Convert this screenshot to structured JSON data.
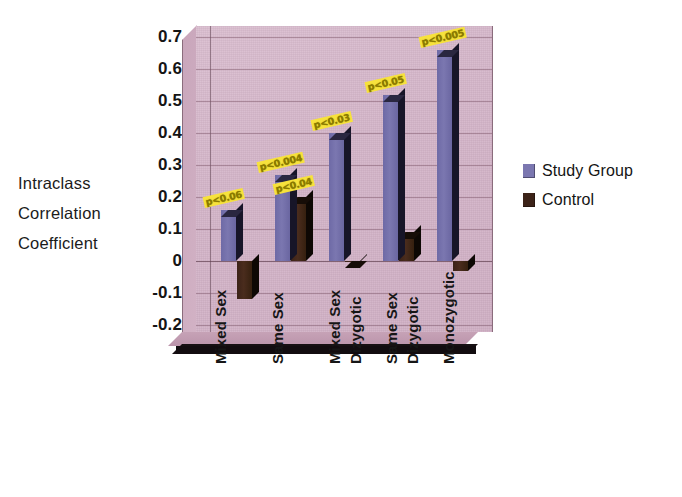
{
  "axis_title_lines": [
    "Intraclass",
    "Correlation",
    "Coefficient"
  ],
  "legend": {
    "items": [
      {
        "label": "Study Group",
        "color": "#7b77b0",
        "name": "legend-study-group"
      },
      {
        "label": "Control",
        "color": "#3c2318",
        "name": "legend-control"
      }
    ]
  },
  "chart_data": {
    "type": "bar",
    "title": "",
    "xlabel": "",
    "ylabel": "Intraclass Correlation Coefficient",
    "ylim": [
      -0.2,
      0.7
    ],
    "ytick_labels": [
      "0.7",
      "0.6",
      "0.5",
      "0.4",
      "0.3",
      "0.2",
      "0.1",
      "0",
      "-0.1",
      "-0.2"
    ],
    "ytick_values": [
      0.7,
      0.6,
      0.5,
      0.4,
      0.3,
      0.2,
      0.1,
      0,
      -0.1,
      -0.2
    ],
    "grid": true,
    "legend_position": "right",
    "three_d": true,
    "categories": [
      "Mixed Sex",
      "Same Sex",
      "Mixed Sex Dizygotic",
      "Same Sex Dizygotic",
      "Monozygotic"
    ],
    "category_lines": [
      [
        "Mixed Sex"
      ],
      [
        "Same Sex"
      ],
      [
        "Mixed Sex",
        "Dizygotic"
      ],
      [
        "Same Sex",
        "Dizygotic"
      ],
      [
        "Monozygotic"
      ]
    ],
    "series": [
      {
        "name": "Study Group",
        "color": "#7b77b0",
        "values": [
          0.16,
          0.27,
          0.4,
          0.52,
          0.66
        ]
      },
      {
        "name": "Control",
        "color": "#3c2318",
        "values": [
          -0.12,
          0.2,
          0.0,
          0.09,
          -0.03
        ]
      }
    ],
    "annotations": [
      {
        "text": "p<0.06",
        "series": "Study Group",
        "category": "Mixed Sex"
      },
      {
        "text": "p<0.004",
        "series": "Study Group",
        "category": "Same Sex"
      },
      {
        "text": "p<0.04",
        "series": "Control",
        "category": "Same Sex"
      },
      {
        "text": "p<0.03",
        "series": "Study Group",
        "category": "Mixed Sex Dizygotic"
      },
      {
        "text": "p<0.05",
        "series": "Study Group",
        "category": "Same Sex Dizygotic"
      },
      {
        "text": "p<0.005",
        "series": "Study Group",
        "category": "Monozygotic"
      }
    ]
  }
}
